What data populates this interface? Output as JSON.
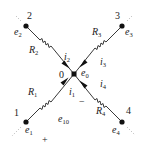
{
  "diagram": {
    "type": "circuit-node-analysis",
    "center_node": {
      "id": "0",
      "label": "0",
      "potential": "e",
      "potential_sub": "0"
    },
    "branches": [
      {
        "node": "2",
        "node_label": "2",
        "potential": "e",
        "potential_sub": "2",
        "resistor": "R",
        "resistor_sub": "2",
        "current": "i",
        "current_sub": "2"
      },
      {
        "node": "3",
        "node_label": "3",
        "potential": "e",
        "potential_sub": "3",
        "resistor": "R",
        "resistor_sub": "3",
        "current": "i",
        "current_sub": "3"
      },
      {
        "node": "1",
        "node_label": "1",
        "potential": "e",
        "potential_sub": "1",
        "resistor": "R",
        "resistor_sub": "1",
        "current": "i",
        "current_sub": "1"
      },
      {
        "node": "4",
        "node_label": "4",
        "potential": "e",
        "potential_sub": "4",
        "resistor": "R",
        "resistor_sub": "4",
        "current": "i",
        "current_sub": "4"
      }
    ],
    "voltage_label": {
      "var": "e",
      "sub": "10",
      "plus": "+",
      "minus": "−"
    }
  }
}
